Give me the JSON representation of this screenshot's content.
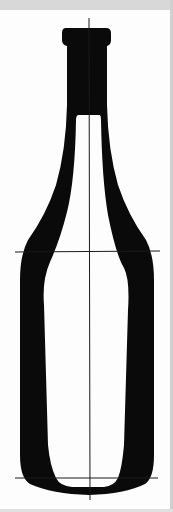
{
  "figure": {
    "colors": {
      "background_strip": "#d8d8d8",
      "paper": "#fdfdfd",
      "ink": "#0a0a0a",
      "guide_line": "#1a1a1a"
    },
    "guides": {
      "vertical_axis": {
        "x": 89,
        "y1": 18,
        "y2": 500
      },
      "shoulder_line": {
        "y": 252,
        "x1": 15,
        "x2": 160
      },
      "base_line": {
        "y": 478,
        "x1": 15,
        "x2": 158
      }
    }
  }
}
